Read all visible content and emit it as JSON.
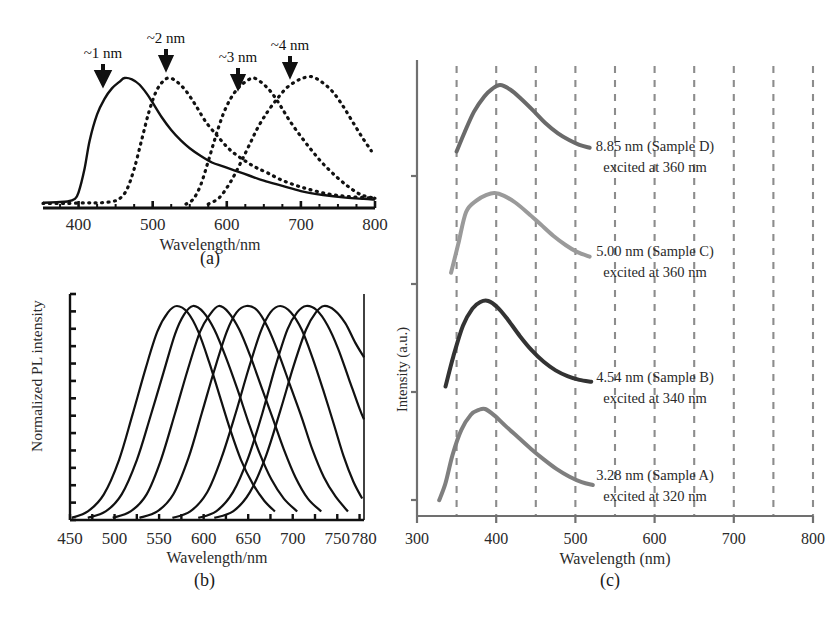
{
  "figure": {
    "background": "#ffffff",
    "panels": [
      "(a)",
      "(b)",
      "(c)"
    ]
  },
  "panel_a": {
    "label": "(a)",
    "xlabel": "Wavelength/nm",
    "xticks": [
      "400",
      "500",
      "600",
      "700",
      "800"
    ],
    "annotations": [
      "~1 nm",
      "~2 nm",
      "~3 nm",
      "~4 nm"
    ]
  },
  "panel_b": {
    "label": "(b)",
    "xlabel": "Wavelength/nm",
    "ylabel": "Normalized PL intensity",
    "xticks": [
      "450",
      "500",
      "550",
      "600",
      "650",
      "700",
      "750",
      "780"
    ]
  },
  "panel_c": {
    "label": "(c)",
    "xlabel": "Wavelength (nm)",
    "ylabel": "Intensity (a.u.)",
    "xticks": [
      "300",
      "400",
      "500",
      "600",
      "700",
      "800"
    ],
    "annotations": [
      {
        "size": "8.85 nm (Sample D)",
        "excitation": "excited at 360 nm",
        "color": "#6a6a6a"
      },
      {
        "size": "5.00 nm (Sample C)",
        "excitation": "excited at 360 nm",
        "color": "#9a9a9a"
      },
      {
        "size": "4.54 nm (Sample B)",
        "excitation": "excited at 340 nm",
        "color": "#333333"
      },
      {
        "size": "3.28 nm (Sample A)",
        "excitation": "excited at 320 nm",
        "color": "#7f7f7f"
      }
    ]
  },
  "chart_data": [
    {
      "type": "line",
      "panel": "(a)",
      "title": "",
      "xlabel": "Wavelength/nm",
      "ylabel": "",
      "xlim": [
        350,
        800
      ],
      "ylim": [
        0,
        1.05
      ],
      "grid": false,
      "legend": "none",
      "tick_labels": [
        "400",
        "500",
        "600",
        "700",
        "800"
      ],
      "annotations": [
        {
          "text": "~1 nm",
          "x": 462,
          "note": "arrow marker above peak 1"
        },
        {
          "text": "~2 nm",
          "x": 525,
          "note": "arrow marker above peak 2"
        },
        {
          "text": "~3 nm",
          "x": 638,
          "note": "arrow marker above peak 3"
        },
        {
          "text": "~4 nm",
          "x": 710,
          "note": "arrow marker above peak 4"
        }
      ],
      "series": [
        {
          "name": "~1 nm",
          "style": "solid",
          "peak_nm": 462,
          "x": [
            352,
            370,
            385,
            395,
            400,
            408,
            415,
            425,
            435,
            445,
            455,
            462,
            472,
            482,
            492,
            500,
            512,
            525,
            538,
            550,
            565,
            580,
            595,
            610,
            630,
            650,
            675,
            700,
            730,
            760,
            785,
            800
          ],
          "y": [
            0.04,
            0.045,
            0.05,
            0.07,
            0.12,
            0.3,
            0.52,
            0.72,
            0.84,
            0.92,
            0.97,
            1.0,
            0.99,
            0.95,
            0.88,
            0.81,
            0.7,
            0.6,
            0.52,
            0.46,
            0.4,
            0.35,
            0.32,
            0.29,
            0.25,
            0.21,
            0.17,
            0.13,
            0.1,
            0.08,
            0.07,
            0.065
          ]
        },
        {
          "name": "~2 nm",
          "style": "dotted",
          "peak_nm": 523,
          "x": [
            352,
            380,
            410,
            430,
            445,
            455,
            465,
            475,
            485,
            495,
            505,
            515,
            523,
            533,
            545,
            558,
            572,
            588,
            602,
            615,
            628,
            640,
            655,
            672,
            690,
            710,
            735,
            760,
            785,
            800
          ],
          "y": [
            0.035,
            0.035,
            0.04,
            0.04,
            0.05,
            0.07,
            0.14,
            0.3,
            0.52,
            0.74,
            0.9,
            0.98,
            1.0,
            0.97,
            0.9,
            0.79,
            0.66,
            0.55,
            0.46,
            0.4,
            0.35,
            0.31,
            0.27,
            0.22,
            0.18,
            0.145,
            0.11,
            0.09,
            0.08,
            0.075
          ]
        },
        {
          "name": "~3 nm",
          "style": "dotted",
          "peak_nm": 636,
          "x": [
            545,
            555,
            565,
            575,
            585,
            595,
            605,
            615,
            625,
            636,
            648,
            660,
            672,
            685,
            700,
            715,
            730,
            748,
            765,
            782,
            800
          ],
          "y": [
            0.03,
            0.07,
            0.18,
            0.36,
            0.55,
            0.72,
            0.84,
            0.92,
            0.97,
            1.0,
            0.96,
            0.89,
            0.79,
            0.67,
            0.55,
            0.44,
            0.34,
            0.24,
            0.16,
            0.1,
            0.075
          ]
        },
        {
          "name": "~4 nm",
          "style": "dotted",
          "peak_nm": 715,
          "x": [
            575,
            590,
            605,
            618,
            630,
            642,
            655,
            668,
            680,
            692,
            703,
            715,
            728,
            742,
            755,
            768,
            782,
            795
          ],
          "y": [
            0.03,
            0.08,
            0.2,
            0.34,
            0.48,
            0.62,
            0.74,
            0.84,
            0.92,
            0.97,
            1.0,
            1.01,
            0.97,
            0.9,
            0.8,
            0.68,
            0.55,
            0.44
          ]
        }
      ]
    },
    {
      "type": "line",
      "panel": "(b)",
      "title": "",
      "xlabel": "Wavelength/nm",
      "ylabel": "Normalized PL intensity",
      "xlim": [
        450,
        780
      ],
      "ylim": [
        0,
        1.05
      ],
      "grid": false,
      "legend": "none",
      "tick_labels": [
        "450",
        "500",
        "550",
        "600",
        "650",
        "700",
        "750",
        "780"
      ],
      "series": [
        {
          "name": "curve 1",
          "peak_nm": 570,
          "x": [
            452,
            470,
            488,
            505,
            520,
            535,
            548,
            560,
            570,
            582,
            594,
            606,
            618,
            630,
            642,
            655,
            668,
            680
          ],
          "y": [
            0.01,
            0.04,
            0.12,
            0.28,
            0.49,
            0.71,
            0.88,
            0.97,
            1.0,
            0.97,
            0.88,
            0.74,
            0.58,
            0.42,
            0.28,
            0.17,
            0.09,
            0.04
          ]
        },
        {
          "name": "curve 2",
          "peak_nm": 588,
          "x": [
            470,
            490,
            508,
            525,
            540,
            555,
            568,
            578,
            588,
            600,
            612,
            625,
            638,
            650,
            663,
            676,
            690,
            705
          ],
          "y": [
            0.01,
            0.04,
            0.12,
            0.28,
            0.48,
            0.69,
            0.87,
            0.96,
            1.0,
            0.97,
            0.89,
            0.76,
            0.61,
            0.46,
            0.31,
            0.19,
            0.1,
            0.04
          ]
        },
        {
          "name": "curve 3",
          "peak_nm": 617,
          "x": [
            498,
            518,
            536,
            552,
            568,
            582,
            596,
            607,
            617,
            628,
            640,
            652,
            665,
            678,
            690,
            703,
            717,
            732
          ],
          "y": [
            0.01,
            0.04,
            0.12,
            0.28,
            0.5,
            0.7,
            0.88,
            0.96,
            1.0,
            0.97,
            0.89,
            0.77,
            0.62,
            0.47,
            0.33,
            0.2,
            0.1,
            0.04
          ]
        },
        {
          "name": "curve 4",
          "peak_nm": 648,
          "x": [
            528,
            548,
            566,
            583,
            598,
            612,
            626,
            637,
            648,
            660,
            672,
            684,
            697,
            710,
            722,
            735,
            748,
            762
          ],
          "y": [
            0.01,
            0.04,
            0.12,
            0.29,
            0.5,
            0.7,
            0.88,
            0.97,
            1.0,
            0.98,
            0.9,
            0.78,
            0.63,
            0.48,
            0.33,
            0.2,
            0.11,
            0.04
          ]
        },
        {
          "name": "curve 5",
          "peak_nm": 686,
          "x": [
            565,
            585,
            604,
            620,
            636,
            650,
            664,
            675,
            686,
            698,
            710,
            722,
            734,
            746,
            757,
            768,
            778
          ],
          "y": [
            0.01,
            0.04,
            0.13,
            0.29,
            0.5,
            0.7,
            0.88,
            0.97,
            1.0,
            0.97,
            0.89,
            0.76,
            0.61,
            0.45,
            0.3,
            0.18,
            0.1
          ]
        },
        {
          "name": "curve 6",
          "peak_nm": 715,
          "x": [
            594,
            614,
            633,
            650,
            666,
            680,
            694,
            705,
            715,
            727,
            739,
            751,
            763,
            775,
            780
          ],
          "y": [
            0.01,
            0.04,
            0.13,
            0.29,
            0.5,
            0.71,
            0.89,
            0.97,
            1.0,
            0.98,
            0.91,
            0.8,
            0.66,
            0.52,
            0.47
          ]
        },
        {
          "name": "curve 7",
          "peak_nm": 735,
          "x": [
            612,
            633,
            652,
            670,
            686,
            701,
            715,
            726,
            735,
            747,
            759,
            770,
            780
          ],
          "y": [
            0.01,
            0.04,
            0.13,
            0.3,
            0.51,
            0.72,
            0.89,
            0.97,
            1.0,
            0.98,
            0.92,
            0.83,
            0.76
          ]
        }
      ]
    },
    {
      "type": "line",
      "panel": "(c)",
      "title": "",
      "xlabel": "Wavelength (nm)",
      "ylabel": "Intensity (a.u.)",
      "xlim": [
        300,
        800
      ],
      "ylim": [
        0,
        4.3
      ],
      "grid": true,
      "grid_spacing_nm": 50,
      "legend": "inline-annotations",
      "tick_labels": [
        "300",
        "400",
        "500",
        "600",
        "700",
        "800"
      ],
      "series": [
        {
          "name": "8.85 nm (Sample D)",
          "excited_nm": 360,
          "color": "#6a6a6a",
          "offset": 3,
          "peak_nm": 405,
          "x": [
            350,
            360,
            372,
            385,
            395,
            405,
            418,
            432,
            448,
            462,
            478,
            492,
            505,
            518
          ],
          "y": [
            0.3,
            0.5,
            0.72,
            0.88,
            0.96,
            1.0,
            0.95,
            0.85,
            0.72,
            0.6,
            0.49,
            0.42,
            0.37,
            0.34
          ]
        },
        {
          "name": "5.00 nm (Sample C)",
          "excited_nm": 360,
          "color": "#9a9a9a",
          "offset": 2,
          "peak_nm": 398,
          "x": [
            343,
            352,
            362,
            375,
            388,
            398,
            410,
            424,
            440,
            456,
            472,
            488,
            502,
            518
          ],
          "y": [
            0.16,
            0.46,
            0.8,
            0.92,
            0.98,
            1.0,
            0.97,
            0.9,
            0.79,
            0.67,
            0.55,
            0.45,
            0.38,
            0.33
          ]
        },
        {
          "name": "4.54 nm (Sample B)",
          "excited_nm": 340,
          "color": "#333333",
          "offset": 1,
          "peak_nm": 390,
          "x": [
            336,
            346,
            358,
            370,
            380,
            390,
            402,
            415,
            430,
            445,
            460,
            475,
            490,
            505,
            520
          ],
          "y": [
            0.1,
            0.42,
            0.74,
            0.92,
            0.99,
            1.0,
            0.93,
            0.8,
            0.63,
            0.48,
            0.36,
            0.27,
            0.21,
            0.17,
            0.15
          ]
        },
        {
          "name": "3.28 nm (Sample A)",
          "excited_nm": 320,
          "color": "#7f7f7f",
          "offset": 0,
          "peak_nm": 382,
          "x": [
            328,
            336,
            345,
            356,
            368,
            378,
            386,
            398,
            412,
            428,
            444,
            460,
            476,
            492,
            508,
            522
          ],
          "y": [
            0.04,
            0.22,
            0.52,
            0.78,
            0.94,
            0.99,
            1.0,
            0.93,
            0.82,
            0.7,
            0.58,
            0.47,
            0.37,
            0.29,
            0.23,
            0.2
          ]
        }
      ]
    }
  ]
}
